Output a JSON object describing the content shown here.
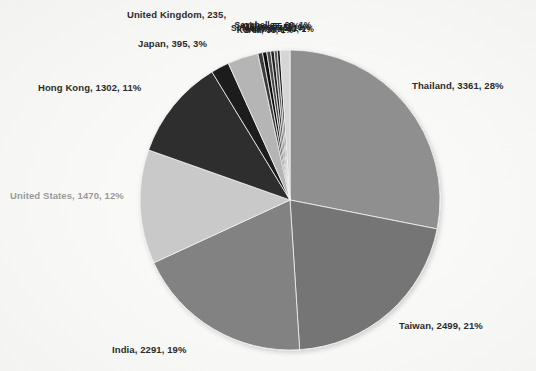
{
  "chart_data": {
    "type": "pie",
    "title": "",
    "legend_position": "none",
    "label_format": "name, value, percent",
    "start_angle_deg": 0,
    "direction": "clockwise",
    "total": 11965,
    "categories": [
      "Thailand",
      "Taiwan",
      "India",
      "United States",
      "Hong Kong",
      "United Kingdom",
      "Japan",
      "Seychelles",
      "China",
      "Malaysia",
      "Singapore",
      "Australia",
      "Korea",
      "Others"
    ],
    "values": [
      3361,
      2499,
      2291,
      1470,
      1302,
      235,
      395,
      60,
      55,
      50,
      45,
      40,
      35,
      127
    ],
    "percents": [
      28,
      21,
      19,
      12,
      11,
      2,
      3,
      1,
      1,
      1,
      1,
      1,
      1,
      1
    ],
    "colors": [
      "#8f8f8f",
      "#757575",
      "#828282",
      "#c9c9c9",
      "#2e2e2e",
      "#1b1b1b",
      "#b5b5b5",
      "#3a3a3a",
      "#101010",
      "#4a4a4a",
      "#202020",
      "#5a5a5a",
      "#141414",
      "#d6d6d6"
    ]
  },
  "labels": {
    "thailand": "Thailand,  3361, 28%",
    "taiwan": "Taiwan,  2499, 21%",
    "india": "India, 2291, 19%",
    "united_states": "United States, 1470, 12%",
    "hong_kong": "Hong Kong, 1302, 11%",
    "japan": "Japan, 395, 3%",
    "united_kingdom": "United Kingdom, 235,",
    "overlapped": [
      "Seychelles, 60, 1%",
      "China, 55, 1%",
      "Malaysia, 50, 1%",
      "Singapore, 45, 1%",
      "Australia, 40, 1%",
      "Korea, 35, 1%"
    ]
  },
  "colors": {
    "background": "#fbfbfa",
    "label_dark": "#2b2b2b",
    "label_muted": "#9a9a98"
  }
}
